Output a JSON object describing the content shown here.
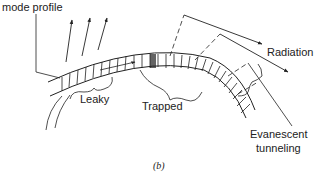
{
  "labels": {
    "mode_profile": "mode profile",
    "radiation": "Radiation",
    "leaky": "Leaky",
    "trapped": "Trapped",
    "evanescent_line1": "Evanescent",
    "evanescent_line2": "tunneling",
    "caption": "(b)"
  },
  "colors": {
    "ink": "#222222",
    "background": "#ffffff"
  }
}
